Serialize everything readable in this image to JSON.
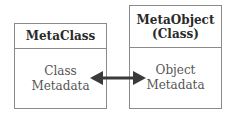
{
  "diagram": {
    "left_box": {
      "title": "MetaClass",
      "body_lines": [
        "Class",
        "Metadata"
      ]
    },
    "right_box": {
      "title_lines": [
        "MetaObject",
        "(Class)"
      ],
      "body_lines": [
        "Object",
        "Metadata"
      ]
    },
    "connector": {
      "type": "bidirectional-arrow",
      "from": "Class Metadata",
      "to": "Object Metadata",
      "color": "#3a3a3a"
    }
  }
}
